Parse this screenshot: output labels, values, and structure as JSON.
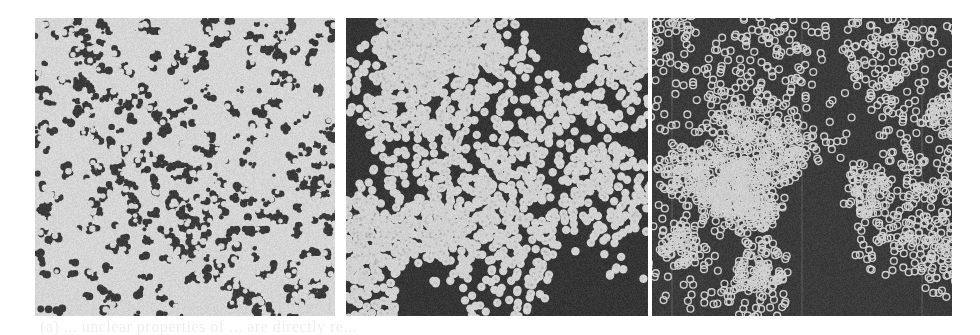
{
  "figure": {
    "background_color": "#ffffff",
    "panels": [
      {
        "id": "a",
        "style": "light-matrix-dark-pores",
        "light_color": "#d6d6d6",
        "dark_color": "#3a3a3a",
        "light_fraction": 0.78,
        "seed": 11
      },
      {
        "id": "b",
        "style": "filled-disk-clusters",
        "light_color": "#d2d2d2",
        "dark_color": "#353535",
        "light_fraction": 0.55,
        "seed": 23
      },
      {
        "id": "c",
        "style": "ring-disk-clusters",
        "light_color": "#cfcfcf",
        "dark_color": "#3b3b3b",
        "light_fraction": 0.42,
        "seed": 37
      }
    ],
    "bleed_through_text": "(a) ... unclear properties of ... are directly re..."
  }
}
